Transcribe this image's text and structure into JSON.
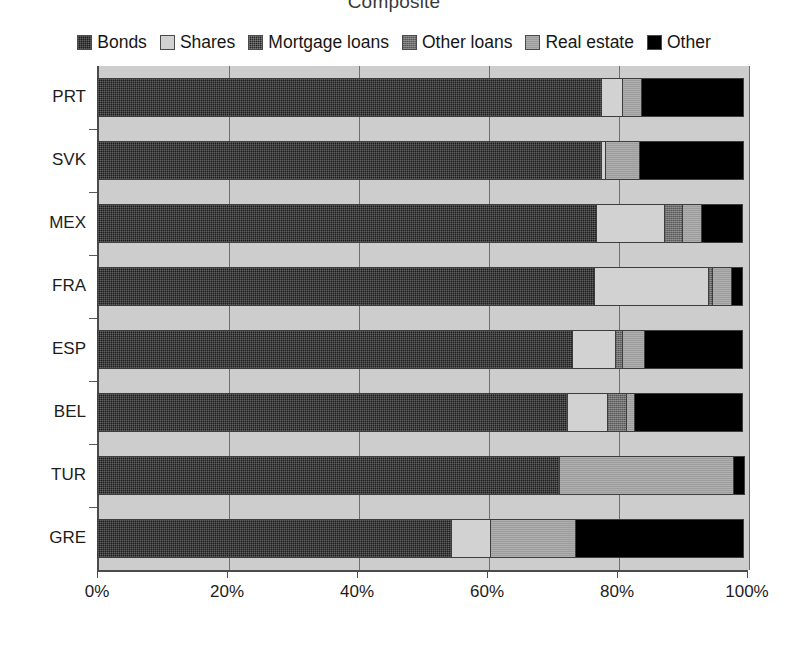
{
  "chart": {
    "title": "Composite",
    "xlabel": "",
    "ylabel": ""
  },
  "legend": {
    "position": "top",
    "items": [
      {
        "label": "Bonds",
        "key": "bonds",
        "color": "#1c1c1c"
      },
      {
        "label": "Shares",
        "key": "shares",
        "color": "#d2d2d2"
      },
      {
        "label": "Mortgage loans",
        "key": "mortgage",
        "color": "#262626"
      },
      {
        "label": "Other loans",
        "key": "otherloans",
        "color": "#6d6d6d"
      },
      {
        "label": "Real estate",
        "key": "realestate",
        "color": "#9d9d9d"
      },
      {
        "label": "Other",
        "key": "other",
        "color": "#000000"
      }
    ]
  },
  "axis": {
    "x_ticks": [
      "0%",
      "20%",
      "40%",
      "60%",
      "80%",
      "100%"
    ],
    "x_tick_values": [
      0,
      20,
      40,
      60,
      80,
      100
    ],
    "x_min": 0,
    "x_max": 100,
    "grid": true
  },
  "chart_data": {
    "type": "bar",
    "orientation": "horizontal",
    "stacked": true,
    "stacked_normalized": true,
    "title": "Composite",
    "xlabel": "",
    "ylabel": "",
    "xlim": [
      0,
      100
    ],
    "grid": true,
    "legend_position": "top",
    "categories": [
      "PRT",
      "SVK",
      "MEX",
      "FRA",
      "ESP",
      "BEL",
      "TUR",
      "GRE"
    ],
    "series": [
      {
        "name": "Bonds",
        "values": [
          77.7,
          77.7,
          76.9,
          76.6,
          73.2,
          72.5,
          71.2,
          54.6
        ]
      },
      {
        "name": "Shares",
        "values": [
          3.4,
          0.8,
          10.6,
          17.7,
          6.8,
          6.2,
          0.0,
          6.2
        ]
      },
      {
        "name": "Mortgage loans",
        "values": [
          0.0,
          0.0,
          0.0,
          0.0,
          0.0,
          0.0,
          0.0,
          0.0
        ]
      },
      {
        "name": "Other loans",
        "values": [
          0.0,
          0.0,
          2.9,
          0.8,
          1.2,
          3.1,
          0.0,
          0.0
        ]
      },
      {
        "name": "Real estate",
        "values": [
          3.1,
          5.4,
          3.1,
          3.1,
          3.5,
          1.5,
          26.9,
          13.2
        ]
      },
      {
        "name": "Other",
        "values": [
          15.8,
          16.1,
          6.5,
          1.8,
          15.3,
          16.7,
          1.9,
          26.0
        ]
      }
    ]
  }
}
